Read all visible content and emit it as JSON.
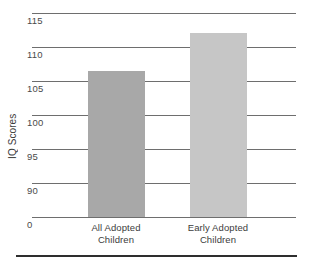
{
  "chart_data": {
    "type": "bar",
    "title": "",
    "xlabel": "",
    "ylabel": "IQ Scores",
    "categories": [
      "All Adopted Children",
      "Early Adopted Children"
    ],
    "values": [
      106.5,
      112
    ],
    "ylim": [
      0,
      115
    ],
    "grid": true,
    "legend": false,
    "axis_break": true,
    "y_ticks": [
      {
        "label": "115",
        "value": 115
      },
      {
        "label": "110",
        "value": 110
      },
      {
        "label": "105",
        "value": 105
      },
      {
        "label": "100",
        "value": 100
      },
      {
        "label": "95",
        "value": 95
      },
      {
        "label": "90",
        "value": 90
      },
      {
        "label": "0",
        "value": 0
      }
    ],
    "series": [
      {
        "name": "IQ Scores",
        "bars": [
          {
            "category_line1": "All Adopted",
            "category_line2": "Children",
            "value": 106.5,
            "color": "#a8a8a8"
          },
          {
            "category_line1": "Early Adopted",
            "category_line2": "Children",
            "value": 112,
            "color": "#c6c6c6"
          }
        ]
      }
    ],
    "colors": {
      "bar_all_adopted": "#a8a8a8",
      "bar_early_adopted": "#c6c6c6",
      "gridline": "#6e6e6e",
      "bottom_rule": "#2e2e2e",
      "text": "#3c3c3c",
      "background": "#ffffff"
    }
  }
}
